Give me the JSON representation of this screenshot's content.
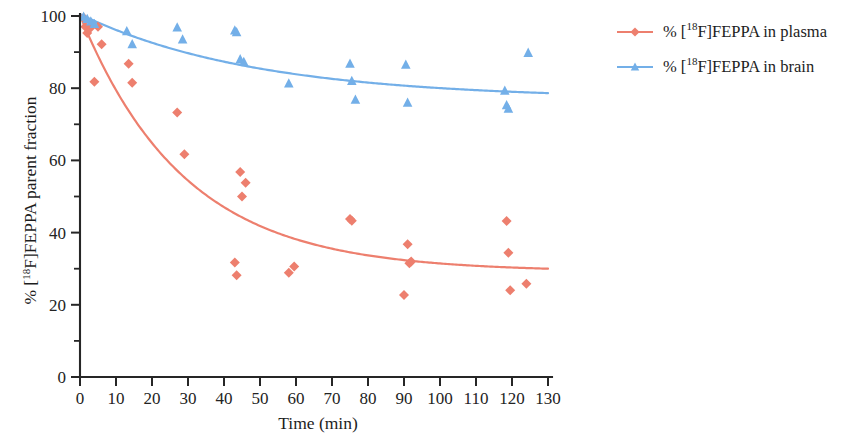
{
  "chart_data": {
    "type": "scatter",
    "title": "",
    "subtitle": "",
    "xlabel": "Time (min)",
    "ylabel": "% [18F]FEPPA parent fraction",
    "ylabel_parts": {
      "pre": "% [",
      "sup": "18",
      "post": "F]FEPPA parent fraction"
    },
    "xlim": [
      0,
      130
    ],
    "ylim": [
      0,
      100
    ],
    "xticks": [
      0,
      10,
      20,
      30,
      40,
      50,
      60,
      70,
      80,
      90,
      100,
      110,
      120,
      130
    ],
    "yticks": [
      0,
      20,
      40,
      60,
      80,
      100
    ],
    "y_minor_ticks": [
      10,
      30,
      50,
      70,
      90
    ],
    "grid": false,
    "legend_position": "right",
    "series": [
      {
        "name": "plasma",
        "legend_pre": "% [",
        "legend_sup": "18",
        "legend_post": "F]FEPPA in plasma",
        "color": "#ED7F6E",
        "marker": "diamond",
        "points": [
          [
            1.0,
            99.5
          ],
          [
            1.5,
            97.0
          ],
          [
            2.0,
            95.3
          ],
          [
            3.0,
            96.8
          ],
          [
            4.0,
            81.8
          ],
          [
            5.0,
            97.0
          ],
          [
            6.0,
            92.2
          ],
          [
            13.5,
            86.8
          ],
          [
            14.5,
            81.5
          ],
          [
            27.0,
            73.3
          ],
          [
            29.0,
            61.7
          ],
          [
            43.0,
            31.7
          ],
          [
            43.5,
            28.2
          ],
          [
            44.5,
            56.8
          ],
          [
            46.0,
            53.8
          ],
          [
            45.0,
            50.0
          ],
          [
            58.0,
            28.9
          ],
          [
            59.5,
            30.6
          ],
          [
            75.0,
            43.8
          ],
          [
            75.5,
            43.3
          ],
          [
            90.0,
            22.7
          ],
          [
            91.0,
            36.8
          ],
          [
            91.5,
            31.5
          ],
          [
            92.0,
            32.0
          ],
          [
            118.5,
            43.2
          ],
          [
            119.0,
            34.4
          ],
          [
            119.5,
            24.0
          ],
          [
            124.0,
            25.8
          ]
        ],
        "fit": {
          "model": "exponential_plus_offset",
          "y0": 100.0,
          "amplitude": 71.0,
          "rate": 0.0345,
          "offset": 29.2
        }
      },
      {
        "name": "brain",
        "legend_pre": "% [",
        "legend_sup": "18",
        "legend_post": "F]FEPPA in brain",
        "color": "#73AFE8",
        "marker": "triangle",
        "points": [
          [
            1.0,
            99.8
          ],
          [
            2.0,
            99.2
          ],
          [
            3.0,
            98.5
          ],
          [
            4.0,
            97.8
          ],
          [
            13.0,
            95.8
          ],
          [
            14.5,
            92.2
          ],
          [
            27.0,
            96.8
          ],
          [
            28.5,
            93.5
          ],
          [
            43.0,
            96.0
          ],
          [
            43.5,
            95.5
          ],
          [
            44.5,
            88.0
          ],
          [
            45.5,
            87.3
          ],
          [
            58.0,
            81.3
          ],
          [
            75.0,
            86.8
          ],
          [
            75.5,
            82.0
          ],
          [
            76.5,
            76.8
          ],
          [
            90.5,
            86.5
          ],
          [
            91.0,
            76.0
          ],
          [
            118.0,
            79.3
          ],
          [
            118.5,
            75.3
          ],
          [
            119.0,
            74.3
          ],
          [
            124.5,
            89.8
          ]
        ],
        "fit": {
          "model": "exponential_plus_offset",
          "y0": 100.0,
          "amplitude": 23.5,
          "rate": 0.0205,
          "offset": 77.0
        }
      }
    ]
  },
  "axes_geometry": {
    "plot_left": 80,
    "plot_right": 548,
    "plot_bottom": 377,
    "plot_top": 16
  },
  "legend": {
    "entries_x": 617,
    "entry_y": [
      32,
      67
    ],
    "swatch_width": 36,
    "text_offset": 46
  }
}
